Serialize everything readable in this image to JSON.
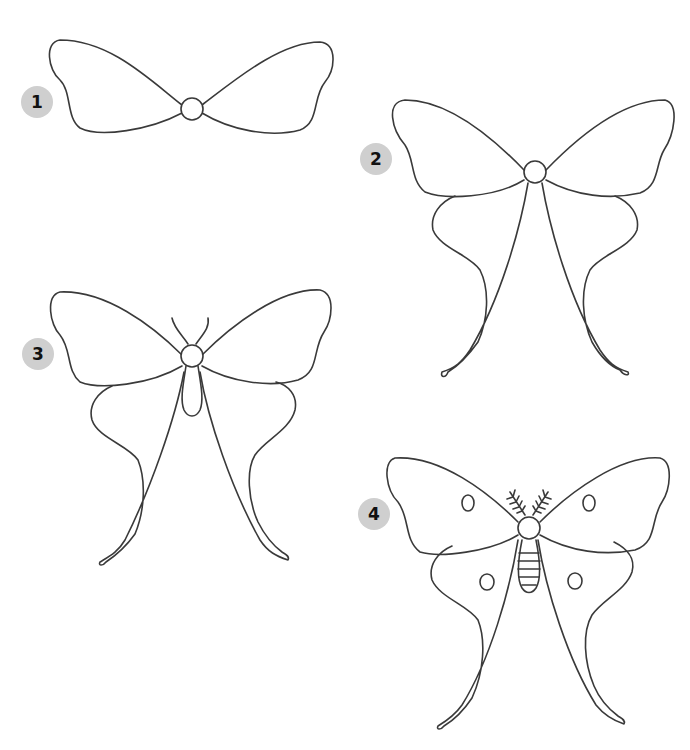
{
  "steps": [
    {
      "number": "1",
      "label": "Forewings and thorax"
    },
    {
      "number": "2",
      "label": "Hindwings with long tails"
    },
    {
      "number": "3",
      "label": "Antennae and abdomen"
    },
    {
      "number": "4",
      "label": "Feathered antennae, eyespots and abdomen stripes"
    }
  ],
  "colors": {
    "badge": "#cfcfcf",
    "line": "#3a3a3a",
    "background": "#ffffff"
  }
}
